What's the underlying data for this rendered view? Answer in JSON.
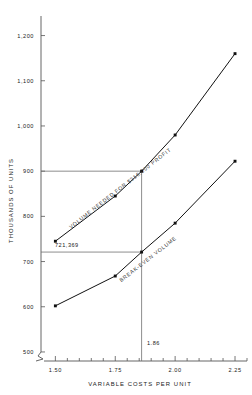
{
  "chart_data": {
    "type": "line",
    "title": "",
    "xlabel": "VARIABLE COSTS PER UNIT",
    "ylabel": "THOUSANDS OF UNITS",
    "xlim": [
      1.44,
      2.3
    ],
    "ylim": [
      480,
      1230
    ],
    "grid": false,
    "legend": "none",
    "x_ticks": [
      1.5,
      1.75,
      2.0,
      2.25
    ],
    "x_tick_labels": [
      "1.50",
      "1.75",
      "2.00",
      "2.25"
    ],
    "x_minor_tick_count": 20,
    "y_ticks": [
      500,
      600,
      700,
      800,
      900,
      1000,
      1100,
      1200
    ],
    "y_tick_labels": [
      "500",
      "600",
      "700",
      "800",
      "900",
      "1,000",
      "1,100",
      "1,200"
    ],
    "axis_break": true,
    "series": [
      {
        "name": "VOLUME NEEDED FOR $316,000 PROFIT",
        "x": [
          1.5,
          1.75,
          1.86,
          2.0,
          2.25
        ],
        "values": [
          745,
          845,
          900,
          980,
          1160
        ]
      },
      {
        "name": "BREAK-EVEN VOLUME",
        "x": [
          1.5,
          1.75,
          1.86,
          2.0,
          2.25
        ],
        "values": [
          602,
          668,
          721,
          785,
          922
        ]
      }
    ],
    "annotations": [
      {
        "name": "profit-curve-label",
        "text": "VOLUME NEEDED FOR $316,000 PROFIT"
      },
      {
        "name": "breakeven-curve-label",
        "text": "BREAK-EVEN VOLUME"
      },
      {
        "name": "breakeven-volume-value",
        "text": "721,369"
      },
      {
        "name": "variable-cost-value",
        "text": "1.86"
      }
    ],
    "guides": [
      {
        "name": "profit-horizontal-guide",
        "y": 900,
        "x_from": 1.44,
        "x_to": 1.86
      },
      {
        "name": "breakeven-horizontal-guide",
        "y": 721,
        "x_from": 1.44,
        "x_to": 1.86
      },
      {
        "name": "breakeven-vertical-guide",
        "x": 1.86,
        "y_from": 480,
        "y_to": 900
      }
    ],
    "colors": {
      "line": "#111111",
      "axis": "#555555",
      "guide": "#707070",
      "text": "#1a1a1a",
      "annotation": "#3a3a3a",
      "background": "#ffffff"
    }
  }
}
